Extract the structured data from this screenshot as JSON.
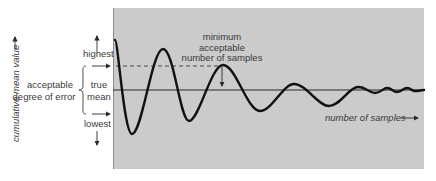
{
  "diagram": {
    "y_axis_label": "cumulative mean value",
    "y_axis_arrow": "—▸",
    "x_axis_label": "number of samples",
    "labels": {
      "highest": "highest",
      "lowest": "lowest",
      "true_mean_line1": "true",
      "true_mean_line2": "mean",
      "error_line1": "acceptable",
      "error_line2": "degree of error",
      "min_samples_line1": "minimum",
      "min_samples_line2": "acceptable",
      "min_samples_line3": "number of samples"
    },
    "colors": {
      "panel": "#cbcbcb",
      "panel_border": "#8a8a8a",
      "curve": "#111111",
      "mean_line": "#2a2a2a",
      "text": "#3a3a3a"
    },
    "curve_points": [
      [
        115,
        40
      ],
      [
        132,
        134
      ],
      [
        163,
        49
      ],
      [
        189,
        121
      ],
      [
        223,
        65
      ],
      [
        260,
        111
      ],
      [
        294,
        84
      ],
      [
        329,
        106
      ],
      [
        358,
        87
      ],
      [
        375,
        93
      ],
      [
        387,
        88
      ],
      [
        397,
        92
      ],
      [
        407,
        88
      ],
      [
        415,
        91
      ],
      [
        424,
        90
      ]
    ],
    "mean_line_y": 90,
    "upper_bound_y": 66,
    "lower_bound_y": 114
  }
}
